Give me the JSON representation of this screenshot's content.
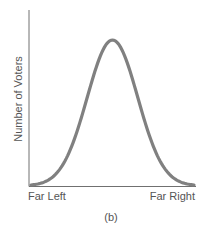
{
  "chart_data": {
    "type": "line",
    "title": "",
    "caption": "(b)",
    "xlabel": "",
    "ylabel": "Number of Voters",
    "x_tick_labels": [
      "Far Left",
      "Far Right"
    ],
    "series": [
      {
        "name": "Voter distribution",
        "description": "Unimodal, symmetric bell-shaped (normal) distribution centered on the middle of the political spectrum",
        "x": [
          0,
          0.1,
          0.2,
          0.3,
          0.4,
          0.5,
          0.6,
          0.7,
          0.8,
          0.9,
          1.0
        ],
        "values": [
          0.0,
          0.04,
          0.17,
          0.45,
          0.82,
          1.0,
          0.82,
          0.45,
          0.17,
          0.04,
          0.0
        ]
      }
    ],
    "xlim": [
      0,
      1
    ],
    "ylim": [
      0,
      1.15
    ],
    "grid": false,
    "legend": "none",
    "colors": {
      "curve": "#808080",
      "axes": "#707070"
    }
  },
  "labels": {
    "y_axis": "Number of Voters",
    "x_left": "Far Left",
    "x_right": "Far Right",
    "caption": "(b)"
  }
}
